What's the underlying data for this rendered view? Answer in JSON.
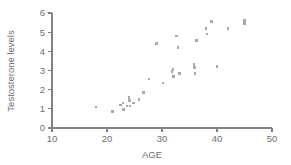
{
  "chart_data": {
    "type": "scatter",
    "title": "",
    "xlabel": "AGE",
    "ylabel": "Testosterone levels",
    "xlim": [
      10,
      50
    ],
    "ylim": [
      0,
      6
    ],
    "xticks": [
      10,
      20,
      30,
      40,
      50
    ],
    "yticks": [
      0,
      1,
      2,
      3,
      4,
      5,
      6
    ],
    "grid": false,
    "legend": null,
    "marker_color": "#a7a9ac",
    "axis_color": "#808285",
    "text_color": "#6d6e71",
    "background_color": "#ffffff",
    "points": [
      {
        "x": 18.0,
        "y": 1.1
      },
      {
        "x": 21.0,
        "y": 0.85
      },
      {
        "x": 22.4,
        "y": 1.2
      },
      {
        "x": 22.9,
        "y": 1.3
      },
      {
        "x": 23.0,
        "y": 0.95
      },
      {
        "x": 23.6,
        "y": 1.15
      },
      {
        "x": 24.0,
        "y": 1.6
      },
      {
        "x": 24.1,
        "y": 1.45
      },
      {
        "x": 24.2,
        "y": 1.15
      },
      {
        "x": 24.8,
        "y": 1.3
      },
      {
        "x": 25.8,
        "y": 1.5
      },
      {
        "x": 26.6,
        "y": 1.85
      },
      {
        "x": 27.6,
        "y": 2.55
      },
      {
        "x": 29.0,
        "y": 4.4
      },
      {
        "x": 30.2,
        "y": 2.35
      },
      {
        "x": 31.8,
        "y": 2.95
      },
      {
        "x": 32.0,
        "y": 3.05
      },
      {
        "x": 32.1,
        "y": 2.7
      },
      {
        "x": 32.6,
        "y": 4.8
      },
      {
        "x": 32.9,
        "y": 4.2
      },
      {
        "x": 33.2,
        "y": 2.85
      },
      {
        "x": 35.8,
        "y": 3.3
      },
      {
        "x": 35.9,
        "y": 3.15
      },
      {
        "x": 36.0,
        "y": 2.85
      },
      {
        "x": 36.3,
        "y": 4.55
      },
      {
        "x": 38.0,
        "y": 5.2
      },
      {
        "x": 38.2,
        "y": 4.9
      },
      {
        "x": 39.0,
        "y": 5.55
      },
      {
        "x": 40.0,
        "y": 3.2
      },
      {
        "x": 42.0,
        "y": 5.2
      },
      {
        "x": 45.0,
        "y": 5.6
      },
      {
        "x": 45.0,
        "y": 5.45
      }
    ]
  }
}
